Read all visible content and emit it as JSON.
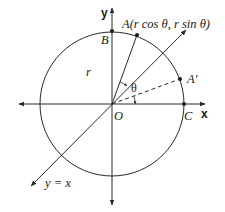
{
  "diagram": {
    "type": "rotation-in-plane",
    "axes": {
      "x_label": "x",
      "y_label": "y"
    },
    "line_label": "y = x",
    "points": {
      "A": "A(r cos θ, r sin θ)",
      "A_prime": "A′",
      "B": "B",
      "C": "C",
      "O": "O"
    },
    "radius_label": "r",
    "angle_label": "θ",
    "colors": {
      "stroke": "#2a2a2a",
      "background": "#ffffff"
    }
  }
}
